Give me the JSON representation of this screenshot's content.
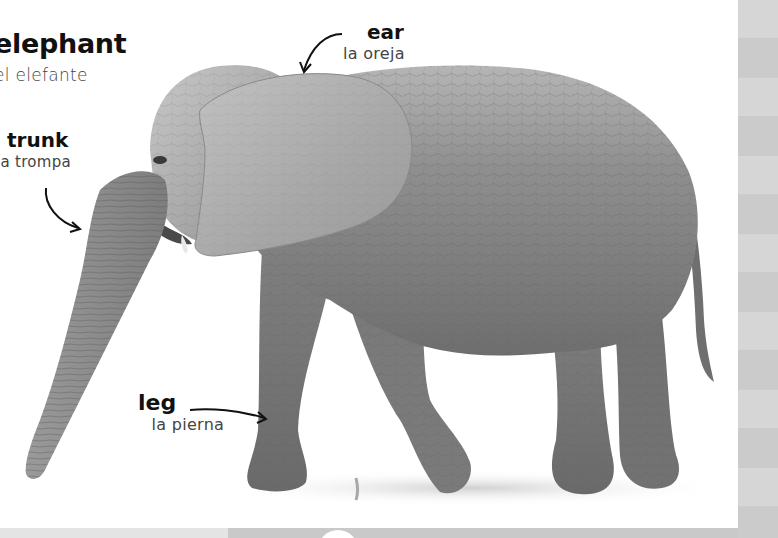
{
  "page": {
    "title_en": "elephant",
    "title_es": "el elefante",
    "background": "#ffffff",
    "edge_colors": [
      "#d6d6d6",
      "#cbcbcb"
    ],
    "bottom_strip_colors": [
      "#e4e4e4",
      "#c9c9c9"
    ]
  },
  "labels": [
    {
      "part": "trunk",
      "en": "trunk",
      "es": "la trompa"
    },
    {
      "part": "ear",
      "en": "ear",
      "es": "la oreja"
    },
    {
      "part": "leg",
      "en": "leg",
      "es": "la pierna"
    }
  ],
  "image": {
    "subject": "African elephant walking, side view facing left, black-and-white photograph",
    "skin_color": "#8a8a8a",
    "ear_color": "#a9a9a9"
  }
}
